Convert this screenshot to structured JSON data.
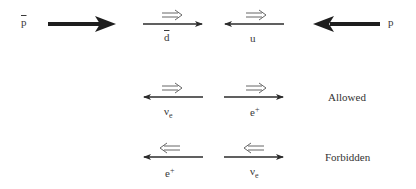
{
  "diagram": {
    "type": "helicity-diagram",
    "colors": {
      "arrow": "#2b2b2b",
      "spin_arrow": "#555555",
      "text": "#333333",
      "background": "#ffffff"
    },
    "row1": {
      "antiproton_label": "p",
      "antiproton_bar": true,
      "antiproton_direction": "right",
      "dbar_label": "d",
      "dbar_bar": true,
      "dbar_momentum": "right",
      "dbar_spin": "⇒",
      "u_label": "u",
      "u_momentum": "left",
      "u_spin": "⇒",
      "proton_label": "p",
      "proton_direction": "left"
    },
    "row2": {
      "nu_label": "ν",
      "nu_sub": "e",
      "nu_momentum": "left",
      "nu_spin": "⇒",
      "e_label": "e",
      "e_sup": "+",
      "e_momentum": "right",
      "e_spin": "⇒",
      "status": "Allowed"
    },
    "row3": {
      "e_label": "e",
      "e_sup": "+",
      "e_momentum": "left",
      "e_spin": "⇐",
      "nu_label": "ν",
      "nu_sub": "e",
      "nu_momentum": "right",
      "nu_spin": "⇐",
      "status": "Forbidden"
    }
  }
}
